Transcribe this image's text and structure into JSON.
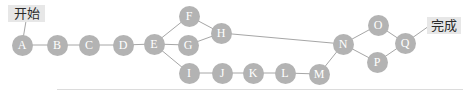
{
  "diagram": {
    "type": "flow-graph",
    "start_label": "开始",
    "end_label": "完成",
    "nodes": [
      {
        "id": "A",
        "label": "A",
        "x": 22,
        "y": 45
      },
      {
        "id": "B",
        "label": "B",
        "x": 57,
        "y": 45
      },
      {
        "id": "C",
        "label": "C",
        "x": 89,
        "y": 45
      },
      {
        "id": "D",
        "label": "D",
        "x": 123,
        "y": 45
      },
      {
        "id": "E",
        "label": "E",
        "x": 154,
        "y": 44
      },
      {
        "id": "F",
        "label": "F",
        "x": 189,
        "y": 16
      },
      {
        "id": "G",
        "label": "G",
        "x": 188,
        "y": 45
      },
      {
        "id": "H",
        "label": "H",
        "x": 221,
        "y": 33
      },
      {
        "id": "I",
        "label": "I",
        "x": 189,
        "y": 73
      },
      {
        "id": "J",
        "label": "J",
        "x": 222,
        "y": 73
      },
      {
        "id": "K",
        "label": "K",
        "x": 253,
        "y": 73
      },
      {
        "id": "L",
        "label": "L",
        "x": 285,
        "y": 73
      },
      {
        "id": "M",
        "label": "M",
        "x": 319,
        "y": 74
      },
      {
        "id": "N",
        "label": "N",
        "x": 343,
        "y": 44
      },
      {
        "id": "O",
        "label": "O",
        "x": 378,
        "y": 25
      },
      {
        "id": "P",
        "label": "P",
        "x": 377,
        "y": 62
      },
      {
        "id": "Q",
        "label": "Q",
        "x": 405,
        "y": 43
      }
    ],
    "start_anchor": {
      "x": 26,
      "y": 21
    },
    "end_anchor": {
      "x": 429,
      "y": 26
    },
    "edges": [
      [
        "start",
        "A"
      ],
      [
        "A",
        "B"
      ],
      [
        "B",
        "C"
      ],
      [
        "C",
        "D"
      ],
      [
        "D",
        "E"
      ],
      [
        "E",
        "F"
      ],
      [
        "E",
        "G"
      ],
      [
        "E",
        "I"
      ],
      [
        "F",
        "H"
      ],
      [
        "G",
        "H"
      ],
      [
        "H",
        "N"
      ],
      [
        "I",
        "J"
      ],
      [
        "J",
        "K"
      ],
      [
        "K",
        "L"
      ],
      [
        "L",
        "M"
      ],
      [
        "M",
        "N"
      ],
      [
        "N",
        "O"
      ],
      [
        "N",
        "P"
      ],
      [
        "O",
        "Q"
      ],
      [
        "P",
        "Q"
      ],
      [
        "Q",
        "end"
      ]
    ],
    "colors": {
      "node_fill": "#b3b3b3",
      "node_text": "#ffffff",
      "edge": "#a6a6a6",
      "label_bg": "#e7e7e7",
      "label_text": "#2b2b2b",
      "rule": "#dcdcdc"
    }
  }
}
